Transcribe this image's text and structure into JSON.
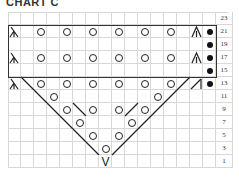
{
  "title": "CHART C",
  "grid": {
    "columns": 16,
    "rows": 12,
    "cell_px": 13
  },
  "row_numbers": [
    "23",
    "21",
    "19",
    "17",
    "15",
    "13",
    "11",
    "9",
    "7",
    "5",
    "3",
    "1"
  ],
  "legend_symbols": {
    "yo": "yarn-over-circle",
    "k2tog": "right-slant-line",
    "ssk": "left-slant-line",
    "sk2p": "left-leaning-lambda",
    "cdd": "centered-double-decrease-A",
    "purl": "filled-dot",
    "kfb": "V-increase",
    "right_dec": "slash-with-bar"
  },
  "rows": {
    "23": [],
    "21": [
      {
        "col": 1,
        "s": "lambda"
      },
      {
        "col": 3,
        "s": "yo"
      },
      {
        "col": 5,
        "s": "yo"
      },
      {
        "col": 7,
        "s": "yo"
      },
      {
        "col": 9,
        "s": "yo"
      },
      {
        "col": 11,
        "s": "yo"
      },
      {
        "col": 13,
        "s": "yo"
      },
      {
        "col": 15,
        "s": "cdd"
      },
      {
        "col": 16,
        "s": "dot"
      }
    ],
    "19": [
      {
        "col": 16,
        "s": "dot"
      }
    ],
    "17": [
      {
        "col": 1,
        "s": "lambda"
      },
      {
        "col": 3,
        "s": "yo"
      },
      {
        "col": 5,
        "s": "yo"
      },
      {
        "col": 7,
        "s": "yo"
      },
      {
        "col": 9,
        "s": "yo"
      },
      {
        "col": 11,
        "s": "yo"
      },
      {
        "col": 13,
        "s": "yo"
      },
      {
        "col": 15,
        "s": "cdd"
      },
      {
        "col": 16,
        "s": "dot"
      }
    ],
    "15": [
      {
        "col": 16,
        "s": "dot"
      }
    ],
    "13": [
      {
        "col": 1,
        "s": "lambda"
      },
      {
        "col": 2,
        "s": "bslash"
      },
      {
        "col": 3,
        "s": "yo"
      },
      {
        "col": 5,
        "s": "yo"
      },
      {
        "col": 7,
        "s": "yo"
      },
      {
        "col": 9,
        "s": "yo"
      },
      {
        "col": 11,
        "s": "yo"
      },
      {
        "col": 13,
        "s": "yo"
      },
      {
        "col": 14,
        "s": "fslash"
      },
      {
        "col": 15,
        "s": "fslashbar"
      },
      {
        "col": 16,
        "s": "dot"
      }
    ],
    "11": [
      {
        "col": 3,
        "s": "bslash"
      },
      {
        "col": 4,
        "s": "yo"
      },
      {
        "col": 12,
        "s": "yo"
      },
      {
        "col": 13,
        "s": "fslash"
      }
    ],
    "9": [
      {
        "col": 4,
        "s": "bslash"
      },
      {
        "col": 5,
        "s": "yo"
      },
      {
        "col": 6,
        "s": "bslash"
      },
      {
        "col": 7,
        "s": "yo"
      },
      {
        "col": 9,
        "s": "yo"
      },
      {
        "col": 10,
        "s": "fslash"
      },
      {
        "col": 11,
        "s": "yo"
      },
      {
        "col": 12,
        "s": "fslash"
      }
    ],
    "7": [
      {
        "col": 5,
        "s": "bslash"
      },
      {
        "col": 6,
        "s": "yo"
      },
      {
        "col": 10,
        "s": "yo"
      },
      {
        "col": 11,
        "s": "fslash"
      }
    ],
    "5": [
      {
        "col": 6,
        "s": "bslash"
      },
      {
        "col": 7,
        "s": "yo"
      },
      {
        "col": 9,
        "s": "yo"
      },
      {
        "col": 10,
        "s": "fslash"
      }
    ],
    "3": [
      {
        "col": 7,
        "s": "bslash"
      },
      {
        "col": 8,
        "s": "yo"
      },
      {
        "col": 9,
        "s": "fslash"
      }
    ],
    "1": [
      {
        "col": 8,
        "s": "V"
      }
    ]
  },
  "repeat_box": {
    "rows": "21-15",
    "cols": "1-16"
  }
}
